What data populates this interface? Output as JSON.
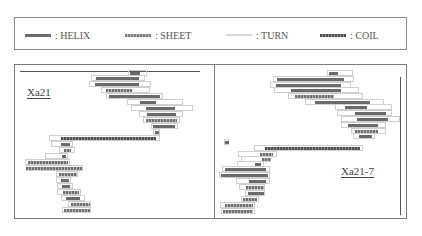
{
  "legend": {
    "items": [
      {
        "key": "helix",
        "label": ": HELIX",
        "x": 10
      },
      {
        "key": "sheet",
        "label": ": SHEET",
        "x": 110
      },
      {
        "key": "turn",
        "label": ": TURN",
        "x": 211
      },
      {
        "key": "coil",
        "label": ": COIL",
        "x": 305
      }
    ]
  },
  "colors": {
    "helix": "#6a6a6a",
    "sheet": "#8a8a8a",
    "turn": "#d9d9d9",
    "coil": "#4d4d4d",
    "border": "#7a7a7a"
  },
  "panels": {
    "left": {
      "title": "Xa21",
      "title_pos": {
        "x": 12,
        "y": 21
      },
      "top_rule": {
        "x": 5,
        "y": 6,
        "w": 180
      },
      "rows": [
        {
          "y": 8,
          "turn": [
            113,
            132
          ],
          "seg": {
            "type": "helix",
            "x": 115,
            "w": 10
          }
        },
        {
          "y": 13,
          "turn": [
            76,
            130
          ],
          "seg": {
            "type": "helix",
            "x": 81,
            "w": 43
          }
        },
        {
          "y": 19,
          "turn": [
            74,
            136
          ],
          "seg": {
            "type": "helix",
            "x": 80,
            "w": 44
          }
        },
        {
          "y": 25,
          "turn": [
            86,
            135
          ],
          "seg": {
            "type": "sheet",
            "x": 91,
            "w": 26
          }
        },
        {
          "y": 31,
          "turn": [
            91,
            148
          ],
          "seg": {
            "type": "helix",
            "x": 94,
            "w": 51
          }
        },
        {
          "y": 37,
          "turn": [
            112,
            168
          ],
          "seg": {
            "type": "helix",
            "x": 125,
            "w": 16
          }
        },
        {
          "y": 43,
          "turn": [
            116,
            178
          ],
          "seg": {
            "type": "helix",
            "x": 131,
            "w": 29
          }
        },
        {
          "y": 49,
          "turn": [
            124,
            168
          ],
          "seg": {
            "type": "helix",
            "x": 132,
            "w": 29
          }
        },
        {
          "y": 55,
          "turn": [
            128,
            165
          ],
          "seg": {
            "type": "sheet",
            "x": 131,
            "w": 31
          }
        },
        {
          "y": 61,
          "turn": [
            136,
            163
          ],
          "seg": {
            "type": "helix",
            "x": 138,
            "w": 22
          }
        },
        {
          "y": 67,
          "turn": [
            138,
            145
          ],
          "seg": {
            "type": "helix",
            "x": 140,
            "w": 4
          }
        },
        {
          "y": 73,
          "turn": [
            34,
            145
          ],
          "seg": {
            "type": "coil",
            "x": 46,
            "w": 95
          }
        },
        {
          "y": 79,
          "turn": [
            36,
            58
          ],
          "seg": {
            "type": "helix",
            "x": 46,
            "w": 9
          }
        },
        {
          "y": 85,
          "turn": [
            44,
            60
          ],
          "seg": {
            "type": "sheet",
            "x": 49,
            "w": 7
          }
        },
        {
          "y": 91,
          "turn": [
            30,
            53
          ],
          "seg": {
            "type": "helix",
            "x": 47,
            "w": 4
          }
        },
        {
          "y": 97,
          "turn": [
            10,
            55
          ],
          "seg": {
            "type": "sheet",
            "x": 13,
            "w": 40
          }
        },
        {
          "y": 103,
          "turn": [
            11,
            68
          ],
          "seg": {
            "type": "sheet",
            "x": 11,
            "w": 56
          }
        },
        {
          "y": 109,
          "turn": [
            41,
            63
          ],
          "seg": {
            "type": "sheet",
            "x": 44,
            "w": 18
          }
        },
        {
          "y": 115,
          "turn": [
            41,
            56
          ],
          "seg": {
            "type": "helix",
            "x": 46,
            "w": 8
          }
        },
        {
          "y": 121,
          "turn": [
            42,
            58
          ],
          "seg": {
            "type": "helix",
            "x": 47,
            "w": 8
          }
        },
        {
          "y": 127,
          "turn": [
            42,
            66
          ],
          "seg": {
            "type": "sheet",
            "x": 48,
            "w": 16
          }
        },
        {
          "y": 133,
          "turn": [
            46,
            70
          ],
          "seg": {
            "type": "helix",
            "x": 51,
            "w": 14
          }
        },
        {
          "y": 139,
          "turn": [
            53,
            76
          ],
          "seg": {
            "type": "sheet",
            "x": 56,
            "w": 19
          }
        },
        {
          "y": 145,
          "turn": [
            47,
            76
          ],
          "seg": {
            "type": "sheet",
            "x": 49,
            "w": 26
          }
        }
      ]
    },
    "right": {
      "title": "Xa21-7",
      "title_pos": {
        "x": 126,
        "y": 100
      },
      "side_rule": {
        "x": 185,
        "y": 12,
        "h": 138
      },
      "rows": [
        {
          "y": 8,
          "turn": [
            112,
            138
          ],
          "seg": {
            "type": "helix",
            "x": 114,
            "w": 9
          }
        },
        {
          "y": 14,
          "turn": [
            58,
            139
          ],
          "seg": {
            "type": "helix",
            "x": 62,
            "w": 67
          }
        },
        {
          "y": 20,
          "turn": [
            55,
            136
          ],
          "seg": {
            "type": "helix",
            "x": 61,
            "w": 65
          }
        },
        {
          "y": 25,
          "turn": [
            59,
            144
          ],
          "seg": {
            "type": "helix",
            "x": 76,
            "w": 50
          }
        },
        {
          "y": 31,
          "turn": [
            73,
            148
          ],
          "seg": {
            "type": "sheet",
            "x": 80,
            "w": 39
          }
        },
        {
          "y": 37,
          "turn": [
            90,
            169
          ],
          "seg": {
            "type": "helix",
            "x": 100,
            "w": 55
          }
        },
        {
          "y": 42,
          "turn": [
            120,
            177
          ],
          "seg": {
            "type": "helix",
            "x": 130,
            "w": 22
          }
        },
        {
          "y": 48,
          "turn": [
            122,
            177
          ],
          "seg": {
            "type": "helix",
            "x": 140,
            "w": 31
          }
        },
        {
          "y": 54,
          "turn": [
            126,
            185
          ],
          "seg": {
            "type": "helix",
            "x": 142,
            "w": 31
          }
        },
        {
          "y": 60,
          "turn": [
            126,
            171
          ],
          "seg": {
            "type": "helix",
            "x": 133,
            "w": 30
          }
        },
        {
          "y": 66,
          "turn": [
            136,
            171
          ],
          "seg": {
            "type": "sheet",
            "x": 140,
            "w": 23
          }
        },
        {
          "y": 71,
          "turn": [
            138,
            160
          ],
          "seg": {
            "type": "helix",
            "x": 144,
            "w": 13
          }
        },
        {
          "y": 77,
          "turn": [
            9,
            14
          ],
          "seg": {
            "type": "helix",
            "x": 10,
            "w": 4
          }
        },
        {
          "y": 83,
          "turn": [
            39,
            148
          ],
          "seg": {
            "type": "coil",
            "x": 50,
            "w": 95
          }
        },
        {
          "y": 89,
          "turn": [
            23,
            62
          ],
          "seg": {
            "type": "sheet",
            "x": 45,
            "w": 13
          }
        },
        {
          "y": 94,
          "turn": [
            26,
            56
          ],
          "seg": {
            "type": "sheet",
            "x": 47,
            "w": 9
          }
        },
        {
          "y": 99,
          "turn": [
            22,
            49
          ],
          "seg": {
            "type": "helix",
            "x": 40,
            "w": 6
          }
        },
        {
          "y": 104,
          "turn": [
            7,
            55
          ],
          "seg": {
            "type": "helix",
            "x": 10,
            "w": 41
          }
        },
        {
          "y": 110,
          "turn": [
            4,
            55
          ],
          "seg": {
            "type": "helix",
            "x": 6,
            "w": 47
          }
        },
        {
          "y": 116,
          "turn": [
            21,
            55
          ],
          "seg": {
            "type": "helix",
            "x": 34,
            "w": 17
          }
        },
        {
          "y": 122,
          "turn": [
            24,
            50
          ],
          "seg": {
            "type": "sheet",
            "x": 31,
            "w": 18
          }
        },
        {
          "y": 128,
          "turn": [
            30,
            50
          ],
          "seg": {
            "type": "helix",
            "x": 33,
            "w": 16
          }
        },
        {
          "y": 134,
          "turn": [
            26,
            44
          ],
          "seg": {
            "type": "sheet",
            "x": 28,
            "w": 14
          }
        },
        {
          "y": 140,
          "turn": [
            5,
            40
          ],
          "seg": {
            "type": "sheet",
            "x": 10,
            "w": 28
          }
        },
        {
          "y": 146,
          "turn": [
            6,
            40
          ],
          "seg": {
            "type": "sheet",
            "x": 8,
            "w": 30
          }
        }
      ]
    }
  }
}
